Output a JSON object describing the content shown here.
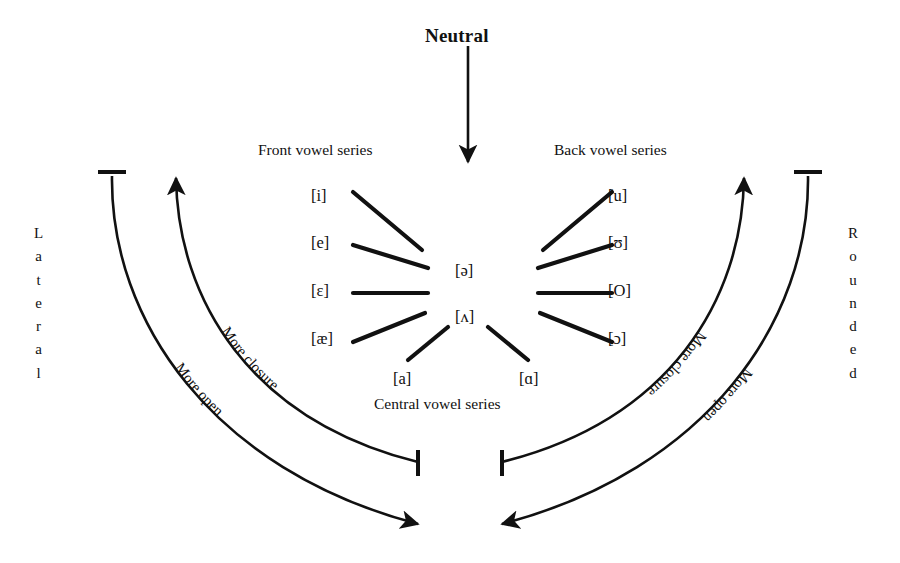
{
  "diagram": {
    "title": "Neutral",
    "background_color": "#ffffff",
    "ink_color": "#111111",
    "series_labels": {
      "front": "Front vowel series",
      "back": "Back vowel series",
      "central": "Central vowel series"
    },
    "side_labels": {
      "left": "Lateral",
      "right": "Rounded"
    },
    "arc_labels": {
      "left_inner": "More closure",
      "left_outer": "More open",
      "right_inner": "More closure",
      "right_outer": "More open"
    },
    "front_vowels": [
      {
        "symbol": "[i]",
        "x": 325,
        "y": 197
      },
      {
        "symbol": "[e]",
        "x": 325,
        "y": 244
      },
      {
        "symbol": "[ɛ]",
        "x": 325,
        "y": 292
      },
      {
        "symbol": "[æ]",
        "x": 325,
        "y": 340
      }
    ],
    "back_vowels": [
      {
        "symbol": "[u]",
        "x": 620,
        "y": 197
      },
      {
        "symbol": "[ʊ]",
        "x": 620,
        "y": 244
      },
      {
        "symbol": "[O]",
        "x": 620,
        "y": 292
      },
      {
        "symbol": "[ɔ]",
        "x": 620,
        "y": 340
      }
    ],
    "central_vowels": [
      {
        "symbol": "[ə]",
        "x": 466,
        "y": 272
      },
      {
        "symbol": "[ʌ]",
        "x": 466,
        "y": 318
      },
      {
        "symbol": "[a]",
        "x": 405,
        "y": 380
      },
      {
        "symbol": "[ɑ]",
        "x": 531,
        "y": 380
      }
    ]
  }
}
